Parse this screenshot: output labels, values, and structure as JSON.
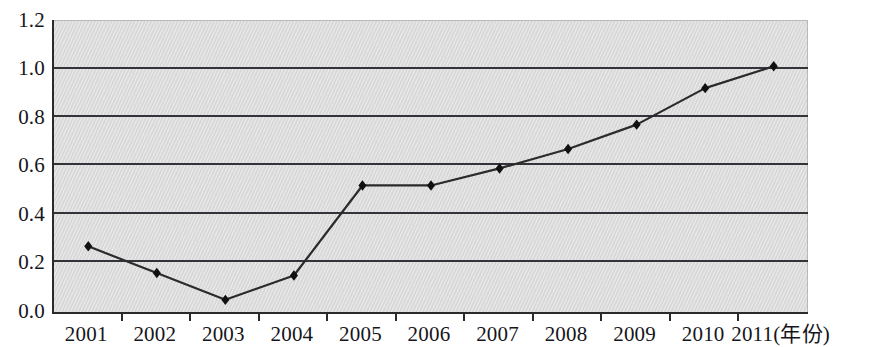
{
  "chart_data": {
    "type": "line",
    "title": "",
    "subtitle": "",
    "xlabel": "(年份)",
    "ylabel": "",
    "categories": [
      "2001",
      "2002",
      "2003",
      "2004",
      "2005",
      "2006",
      "2007",
      "2008",
      "2009",
      "2010",
      "2011"
    ],
    "values": [
      0.27,
      0.16,
      0.05,
      0.15,
      0.52,
      0.52,
      0.59,
      0.67,
      0.77,
      0.92,
      1.01
    ],
    "series": [
      {
        "name": "",
        "values": [
          0.27,
          0.16,
          0.05,
          0.15,
          0.52,
          0.52,
          0.59,
          0.67,
          0.77,
          0.92,
          1.01
        ]
      }
    ],
    "ylim": [
      0.0,
      1.2
    ],
    "ytick_labels": [
      "0.0",
      "0.2",
      "0.4",
      "0.6",
      "0.8",
      "1.0",
      "1.2"
    ],
    "ytick_values": [
      0.0,
      0.2,
      0.4,
      0.6,
      0.8,
      1.0,
      1.2
    ],
    "xtick_labels": [
      "2001",
      "2002",
      "2003",
      "2004",
      "2005",
      "2006",
      "2007",
      "2008",
      "2009",
      "2010",
      "2011(年份)"
    ],
    "grid": true,
    "grid_axis": "y",
    "legend": false,
    "legend_position": "none",
    "marker": "diamond",
    "annotations": []
  },
  "style": {
    "plot_background": "#dcdcdc",
    "gridline_color": "#33333a",
    "axis_color": "#2b2b2b",
    "series_color": "#2b2b2b",
    "marker_color": "#111111",
    "text_color": "#16161a",
    "page_background": "#ffffff"
  }
}
